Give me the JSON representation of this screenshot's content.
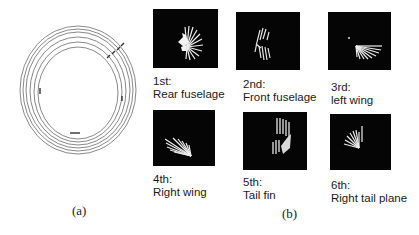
{
  "panel_a": {
    "caption": "(a)",
    "rings": 6
  },
  "panel_b": {
    "caption": "(b)",
    "items": [
      {
        "order": "1st:",
        "part": "Rear fuselage"
      },
      {
        "order": "2nd:",
        "part": "Front fuselage"
      },
      {
        "order": "3rd:",
        "part": "left wing"
      },
      {
        "order": "4th:",
        "part": "Right wing"
      },
      {
        "order": "5th:",
        "part": "Tail fin"
      },
      {
        "order": "6th:",
        "part": "Right tail plane"
      }
    ]
  }
}
